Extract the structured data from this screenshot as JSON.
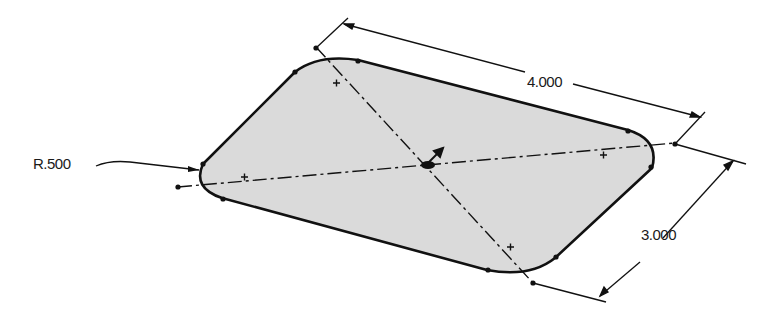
{
  "drawing": {
    "type": "isometric sketch of rounded rectangle plate",
    "fill_color": "#d9d9d9",
    "line_color": "#111111",
    "dimensions": {
      "length": "4.000",
      "width": "3.000",
      "corner_radius": "R.500"
    },
    "centerlines": 2,
    "corner_center_marks": 4
  }
}
